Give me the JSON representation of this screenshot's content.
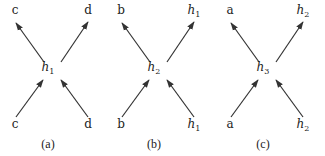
{
  "panels": [
    {
      "caption": "(a)",
      "center": {
        "base": "h",
        "sub": "1"
      },
      "top_left": {
        "base": "c",
        "sub": ""
      },
      "top_right": {
        "base": "d",
        "sub": ""
      },
      "bottom_left": {
        "base": "c",
        "sub": ""
      },
      "bottom_right": {
        "base": "d",
        "sub": ""
      }
    },
    {
      "caption": "(b)",
      "center": {
        "base": "h",
        "sub": "2"
      },
      "top_left": {
        "base": "b",
        "sub": ""
      },
      "top_right": {
        "base": "h",
        "sub": "1"
      },
      "bottom_left": {
        "base": "b",
        "sub": ""
      },
      "bottom_right": {
        "base": "h",
        "sub": "1"
      }
    },
    {
      "caption": "(c)",
      "center": {
        "base": "h",
        "sub": "3"
      },
      "top_left": {
        "base": "a",
        "sub": ""
      },
      "top_right": {
        "base": "h",
        "sub": "2"
      },
      "bottom_left": {
        "base": "a",
        "sub": ""
      },
      "bottom_right": {
        "base": "h",
        "sub": "2"
      }
    }
  ],
  "edges": [
    {
      "from": "bottom_left",
      "to": "center"
    },
    {
      "from": "bottom_right",
      "to": "center"
    },
    {
      "from": "center",
      "to": "top_left"
    },
    {
      "from": "center",
      "to": "top_right"
    }
  ]
}
